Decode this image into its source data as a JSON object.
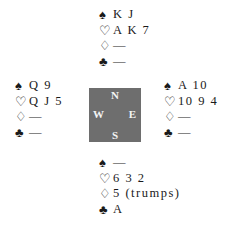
{
  "hands": {
    "north": {
      "spades": "K J",
      "hearts": "A K 7",
      "diamonds": "—",
      "clubs": "—"
    },
    "west": {
      "spades": "Q 9",
      "hearts": "Q J 5",
      "diamonds": "—",
      "clubs": "—"
    },
    "east": {
      "spades": "A 10",
      "hearts": "10 9 4",
      "diamonds": "—",
      "clubs": "—"
    },
    "south": {
      "spades": "—",
      "hearts": "6 3 2",
      "diamonds": "5 (trumps)",
      "clubs": "A"
    }
  },
  "suits": {
    "spades": "♠",
    "hearts": "♡",
    "diamonds": "♢",
    "clubs": "♣"
  },
  "compass": {
    "north": "N",
    "west": "W",
    "east": "E",
    "south": "S",
    "color": "#6e6e6e"
  }
}
